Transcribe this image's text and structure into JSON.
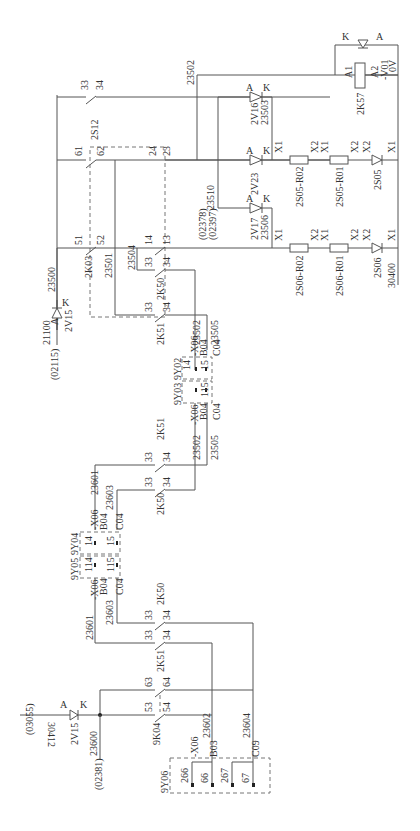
{
  "diagram": {
    "type": "electrical-schematic",
    "orientation": "rotated-90-ccw",
    "labels": {
      "ref_03055": "(03055)",
      "ref_30412": "30412",
      "v15a_A": "A",
      "v15a_K": "K",
      "v15a_name": "2V15",
      "w23600": "23600",
      "ref_02381": "(02381)",
      "k04_53": "53",
      "k04_54": "54",
      "k04_63": "63",
      "k04_64": "64",
      "k04_name": "9K04",
      "w23602": "23602",
      "w23604": "23604",
      "y06_name": "9Y06",
      "y06_x06": "-X06",
      "y06_b03": "B03",
      "y06_c09": "C09",
      "y06_266": "266",
      "y06_66": "66",
      "y06_267": "267",
      "y06_67": "67",
      "k51a_name": "2K51",
      "k51a_33": "33",
      "k51a_34": "34",
      "k50a_name": "2K50",
      "k50a_33": "33",
      "k50a_34": "34",
      "w23601a": "23601",
      "w23603a": "23603",
      "y05_name": "9Y05",
      "y05_x06": "-X06",
      "y05_b04": "B04",
      "y05_c04": "C04",
      "y05_114": "114",
      "y05_115": "115",
      "y04_name": "9Y04",
      "y04_x06": "-X06",
      "y04_b04": "B04",
      "y04_c04": "C04",
      "y04_14": "14",
      "y04_15": "15",
      "w23601b": "23601",
      "w23603b": "23603",
      "k51b_name": "2K51",
      "k51b_33": "33",
      "k51b_34": "34",
      "k50b_name": "2K50",
      "k50b_33": "33",
      "k50b_34": "34",
      "w23502a": "23502",
      "w23505a": "23505",
      "y03_name": "9Y03",
      "y03_x06": "-X06",
      "y03_b04": "B04",
      "y03_c04": "C04",
      "y03_115": "115",
      "y02_name": "9Y02",
      "y02_x06": "-X06",
      "y02_b04": "B04",
      "y02_c04": "C04",
      "y02_14": "14",
      "y02_15": "15",
      "w23502b": "23502",
      "w23505b": "23505",
      "k51c_name": "2K51",
      "k51c_33": "33",
      "k51c_34": "34",
      "k50c_name": "2K50",
      "k50c_33": "33",
      "k50c_34": "34",
      "w23504": "23504",
      "k03_name": "2K03",
      "k03_51": "51",
      "k03_52": "52",
      "w23501": "23501",
      "k_14": "14",
      "k_13": "13",
      "w23500": "23500",
      "ref_02115": "(02115)",
      "w21100": "21100",
      "v15b_A": "A",
      "v15b_K": "K",
      "v15b_name": "2V15",
      "s12_name": "2S12",
      "s12_33": "33",
      "s12_34": "34",
      "c_61": "61",
      "c_62": "62",
      "c_24": "24",
      "c_23": "23",
      "w23502c": "23502",
      "w23510": "23510",
      "ref_02378": "(02378)",
      "ref_02397": "(02397)",
      "v16_A": "A",
      "v16_K": "K",
      "v16_name": "2V16",
      "w23503": "23503",
      "v23_A": "A",
      "v23_K": "K",
      "v23_name": "2V23",
      "v17_A": "A",
      "v17_K": "K",
      "v17_name": "2V17",
      "w23506": "23506",
      "r05_02": "2S05-R02",
      "r05_01": "2S05-R01",
      "s05": "2S05",
      "r06_02": "2S06-R02",
      "r06_01": "2S06-R01",
      "s06": "2S06",
      "x1": "X1",
      "x2": "X2",
      "w30400": "30400",
      "k57_name": "2K57",
      "k57_a1": "A1",
      "k57_a2": "A2",
      "v01_name": "-V01",
      "v01_K": "K",
      "v01_A": "A",
      "zero_v": "0V"
    }
  }
}
